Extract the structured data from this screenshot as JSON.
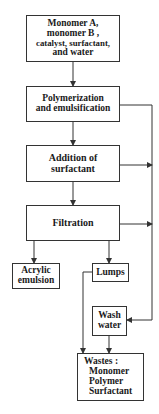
{
  "nodes": {
    "inputs": {
      "lines": [
        "Monomer A,",
        "monomer B ,",
        "catalyst, surfactant,",
        "and water"
      ]
    },
    "polymerization": {
      "lines": [
        "Polymerization",
        "and emulsification"
      ]
    },
    "addition": {
      "lines": [
        "Addition of",
        "surfactant"
      ]
    },
    "filtration": {
      "lines": [
        "Filtration"
      ]
    },
    "acrylic": {
      "lines": [
        "Acrylic",
        "emulsion"
      ]
    },
    "lumps": {
      "lines": [
        "Lumps"
      ]
    },
    "wash": {
      "lines": [
        "Wash",
        "water"
      ]
    },
    "wastes": {
      "title": "Wastes :",
      "items": [
        "Monomer",
        "Polymer",
        "Surfactant"
      ]
    }
  },
  "edges": [
    {
      "from": "inputs",
      "to": "polymerization"
    },
    {
      "from": "polymerization",
      "to": "addition"
    },
    {
      "from": "addition",
      "to": "filtration"
    },
    {
      "from": "filtration",
      "to": "acrylic"
    },
    {
      "from": "filtration",
      "to": "lumps"
    },
    {
      "from": "polymerization",
      "to": "wash"
    },
    {
      "from": "addition",
      "to": "wash"
    },
    {
      "from": "filtration",
      "to": "wash"
    },
    {
      "from": "lumps",
      "to": "wastes"
    },
    {
      "from": "wash",
      "to": "wastes"
    }
  ]
}
